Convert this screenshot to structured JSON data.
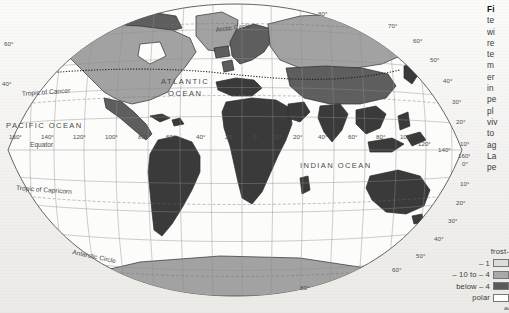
{
  "figure": {
    "caption_lines": [
      "Fi",
      "te",
      "wi",
      "re",
      "te",
      "m",
      "er",
      "in",
      "pe",
      "pl",
      "viv",
      "to",
      "ag",
      "La",
      "pe"
    ]
  },
  "map": {
    "projection_name": "world-oval-graticule",
    "ocean_labels": [
      {
        "text": "ATLANTIC",
        "x": 161,
        "y": 84,
        "size": 7.6,
        "rotate": 0,
        "spacing": 1.5
      },
      {
        "text": "OCEAN",
        "x": 168,
        "y": 96,
        "size": 7.6,
        "rotate": 0,
        "spacing": 1.5
      },
      {
        "text": "PACIFIC OCEAN",
        "x": 6,
        "y": 128,
        "size": 7.6,
        "rotate": 0,
        "spacing": 1.4
      },
      {
        "text": "INDIAN OCEAN",
        "x": 300,
        "y": 168,
        "size": 7.6,
        "rotate": 0,
        "spacing": 1.4
      }
    ],
    "special_lines": [
      {
        "text": "Arctic Circle",
        "x": 216,
        "y": 32,
        "size": 6.6,
        "rotate": -7
      },
      {
        "text": "Tropic of Cancer",
        "x": 22,
        "y": 96,
        "size": 6.6,
        "rotate": -4
      },
      {
        "text": "Equator",
        "x": 30,
        "y": 147,
        "size": 6.6,
        "rotate": 0
      },
      {
        "text": "Tropic of Capricorn",
        "x": 16,
        "y": 190,
        "size": 6.6,
        "rotate": 4
      },
      {
        "text": "Antarctic Circle",
        "x": 72,
        "y": 254,
        "size": 6.6,
        "rotate": 12
      }
    ],
    "longitude_labels": [
      {
        "text": "160°",
        "x": 9,
        "y": 139
      },
      {
        "text": "140°",
        "x": 41,
        "y": 139
      },
      {
        "text": "120°",
        "x": 73,
        "y": 139
      },
      {
        "text": "100°",
        "x": 105,
        "y": 139
      },
      {
        "text": "80°",
        "x": 138,
        "y": 139
      },
      {
        "text": "60°",
        "x": 166,
        "y": 139
      },
      {
        "text": "40°",
        "x": 196,
        "y": 139
      },
      {
        "text": "20°",
        "x": 225,
        "y": 139
      },
      {
        "text": "0°",
        "x": 253,
        "y": 139
      },
      {
        "text": "10°",
        "x": 272,
        "y": 139
      },
      {
        "text": "20°",
        "x": 293,
        "y": 139
      },
      {
        "text": "40°",
        "x": 318,
        "y": 139
      },
      {
        "text": "60°",
        "x": 348,
        "y": 139
      },
      {
        "text": "80°",
        "x": 376,
        "y": 139
      },
      {
        "text": "100°",
        "x": 400,
        "y": 139
      },
      {
        "text": "120°",
        "x": 418,
        "y": 146
      },
      {
        "text": "140°",
        "x": 438,
        "y": 152
      },
      {
        "text": "160°",
        "x": 458,
        "y": 158
      }
    ],
    "latitude_labels_right": [
      {
        "text": "80°",
        "x": 318,
        "y": 16
      },
      {
        "text": "70°",
        "x": 388,
        "y": 28
      },
      {
        "text": "60°",
        "x": 413,
        "y": 43
      },
      {
        "text": "50°",
        "x": 430,
        "y": 62
      },
      {
        "text": "40°",
        "x": 443,
        "y": 83
      },
      {
        "text": "30°",
        "x": 452,
        "y": 104
      },
      {
        "text": "20°",
        "x": 456,
        "y": 124
      },
      {
        "text": "10°",
        "x": 460,
        "y": 146
      },
      {
        "text": "0°",
        "x": 462,
        "y": 166
      },
      {
        "text": "10°",
        "x": 460,
        "y": 186
      },
      {
        "text": "20°",
        "x": 456,
        "y": 205
      },
      {
        "text": "30°",
        "x": 448,
        "y": 223
      },
      {
        "text": "40°",
        "x": 434,
        "y": 241
      },
      {
        "text": "50°",
        "x": 416,
        "y": 258
      },
      {
        "text": "60°",
        "x": 392,
        "y": 272
      },
      {
        "text": "80°",
        "x": 300,
        "y": 290
      }
    ],
    "latitude_labels_left": [
      {
        "text": "60°",
        "x": 4,
        "y": 46
      },
      {
        "text": "40°",
        "x": 2,
        "y": 86
      }
    ]
  },
  "legend": {
    "rows": [
      {
        "text": "frost-",
        "swatch": "",
        "dot": false
      },
      {
        "text": "– 1",
        "swatch": "#dcdcdc",
        "dot": false
      },
      {
        "text": "– 10 to – 4",
        "swatch": "#a8a8a8",
        "dot": false
      },
      {
        "text": "below – 4",
        "swatch": "#5a5a5a",
        "dot": false
      },
      {
        "text": "polar",
        "swatch": "#ffffff",
        "dot": false
      },
      {
        "text": "",
        "swatch": "",
        "dot": true
      }
    ]
  },
  "colors": {
    "shade_light": "#d9d9d9",
    "shade_mid": "#a3a3a3",
    "shade_dark": "#5e5e5e",
    "shade_darkest": "#3a3a3a",
    "graticule": "#8d8d8d",
    "coast": "#2e2e2e",
    "paper": "#f4f3f1"
  }
}
